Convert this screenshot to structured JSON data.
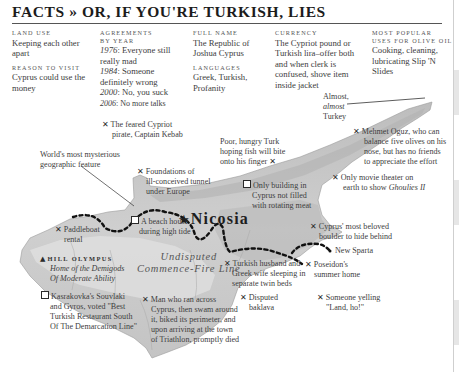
{
  "header": {
    "title": "FACTS » OR, IF YOU'RE TURKISH, LIES"
  },
  "facts": [
    {
      "label": "LAND USE",
      "value": "Keeping each other apart"
    },
    {
      "label": "REASON TO VISIT",
      "value": "Cyprus could use the money"
    },
    {
      "label": "AGREEMENTS BY YEAR",
      "entries": [
        {
          "year": "1976",
          "text": ": Everyone still really mad"
        },
        {
          "year": "1984",
          "text": ": Someone definitely wrong"
        },
        {
          "year": "2000",
          "text": ": No, you suck"
        },
        {
          "year": "2006",
          "text": ": No more talks"
        }
      ]
    },
    {
      "label": "FULL NAME",
      "value": "The Republic of Joshua Cyprus"
    },
    {
      "label": "LANGUAGES",
      "value": "Greek, Turkish, Profanity"
    },
    {
      "label": "CURRENCY",
      "value": "The Cypriot pound or Turkish lira–offer both and when clerk is confused, shove item inside jacket"
    },
    {
      "label": "MOST POPULAR USES FOR OLIVE OIL",
      "value": "Cooking, cleaning, lubricating Slip 'N Slides"
    }
  ],
  "map": {
    "capital": "Nicosia",
    "line_label_1": "Undisputed",
    "line_label_2": "Commence-Fire Line",
    "colors": {
      "land": "#c9c9c9",
      "land_light": "#e3e3e3",
      "land_dark": "#b1b1b1",
      "border_line": "#111111",
      "text": "#3d3d3d"
    },
    "annotations": {
      "almost_turkey": [
        "Almost,",
        "almost",
        "Turkey"
      ],
      "kebab": [
        "The feared Cypriot",
        "pirate, Captain Kebab"
      ],
      "hungry_turk": [
        "Poor, hungry Turk",
        "hoping fish will bite",
        "onto his finger"
      ],
      "mehmet": [
        "Mehmet Oguz, who can",
        "balance five olives on his",
        "nose, but has no friends",
        "to appreciate the effort"
      ],
      "mysterious": [
        "World's most mysterious",
        "geographic feature"
      ],
      "tunnel": [
        "Foundations of",
        "ill-conceived tunnel",
        "under Europe"
      ],
      "rotating_meat": [
        "Only building in",
        "Cyprus not filled",
        "with rotating meat"
      ],
      "movie_theater": [
        "Only movie theater on",
        "earth to show "
      ],
      "movie_title": "Ghoulies II",
      "paddleboat": [
        "Paddleboat",
        "rental"
      ],
      "beach_house": [
        "A beach house",
        "during high tide"
      ],
      "boulder": [
        "Cyprus' most beloved",
        "boulder to hide behind"
      ],
      "new_sparta": "New Sparta",
      "hill_olympus": "HILL OLYMPUS",
      "olympus_desc": [
        "Home of the Demigods",
        "Of Moderate Ability"
      ],
      "twin_beds": [
        "Turkish husband and",
        "Greek wife sleeping in",
        "separate twin beds"
      ],
      "poseidon": [
        "Poseidon's",
        "summer home"
      ],
      "souvlaki": [
        "Kasrakovka's Souvlaki",
        "and Gyros, voted \"Best",
        "Turkish Restaurant South",
        "Of The Demarcation Line\""
      ],
      "triathlon": [
        "Man who ran across",
        "Cyprus, then swam around",
        "it, biked its perimeter, and",
        "upon arriving at the town",
        "of Triathlon, promptly died"
      ],
      "baklava": [
        "Disputed",
        "baklava"
      ],
      "land_ho": [
        "Someone yelling",
        "\"Land, ho!\""
      ]
    },
    "icons": {
      "x_mark": "✕",
      "square": "□",
      "triangle": "▲",
      "star": "★"
    }
  }
}
